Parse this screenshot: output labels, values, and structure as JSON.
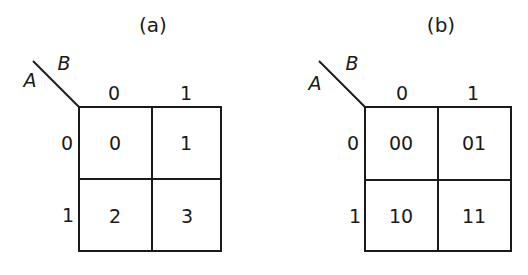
{
  "diagrams": [
    {
      "title": "(a)",
      "row_var": "A",
      "col_var": "B",
      "col_labels": [
        "0",
        "1"
      ],
      "row_labels": [
        "0",
        "1"
      ],
      "cells": [
        [
          "0",
          "1"
        ],
        [
          "2",
          "3"
        ]
      ]
    },
    {
      "title": "(b)",
      "row_var": "A",
      "col_var": "B",
      "col_labels": [
        "0",
        "1"
      ],
      "row_labels": [
        "0",
        "1"
      ],
      "cells": [
        [
          "00",
          "01"
        ],
        [
          "10",
          "11"
        ]
      ]
    }
  ],
  "colors": {
    "ink": "#1a1a1a",
    "background": "#ffffff"
  }
}
